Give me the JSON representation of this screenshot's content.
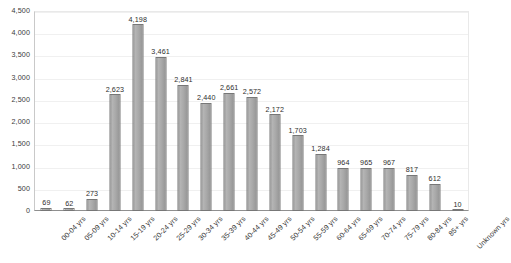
{
  "chart_data": {
    "type": "bar",
    "title": "",
    "subtitle": "",
    "xlabel": "",
    "ylabel": "",
    "ylim": [
      0,
      4500
    ],
    "ytick_step": 500,
    "grid": true,
    "legend": false,
    "legend_position": "none",
    "bar_color": "#a9a9a9",
    "bar_border_color": "#777777",
    "axis_color": "#8f8f8f",
    "gridline_color": "#f0f0f0",
    "text_color": "#3a3a3a",
    "ytick_labels": [
      "4,500",
      "4,000",
      "3,500",
      "3,000",
      "2,500",
      "2,000",
      "1,500",
      "1,000",
      "500",
      "0"
    ],
    "ytick_values": [
      4500,
      4000,
      3500,
      3000,
      2500,
      2000,
      1500,
      1000,
      500,
      0
    ],
    "categories": [
      "00-04 yrs",
      "05-09 yrs",
      "10-14 yrs",
      "15-19 yrs",
      "20-24 yrs",
      "25-29 yrs",
      "30-34 yrs",
      "35-39 yrs",
      "40-44 yrs",
      "45-49 yrs",
      "50-54 yrs",
      "55-59 yrs",
      "60-64 yrs",
      "65-69 yrs",
      "70-74 yrs",
      "75-79 yrs",
      "80-84 yrs",
      "85+ yrs",
      "Unknown yrs"
    ],
    "values": [
      69,
      62,
      273,
      2623,
      4198,
      3461,
      2841,
      2440,
      2661,
      2572,
      2172,
      1703,
      1284,
      964,
      965,
      967,
      817,
      612,
      10
    ],
    "data_labels": [
      "69",
      "62",
      "273",
      "2,623",
      "4,198",
      "3,461",
      "2,841",
      "2,440",
      "2,661",
      "2,572",
      "2,172",
      "1,703",
      "1,284",
      "964",
      "965",
      "967",
      "817",
      "612",
      "10"
    ]
  }
}
